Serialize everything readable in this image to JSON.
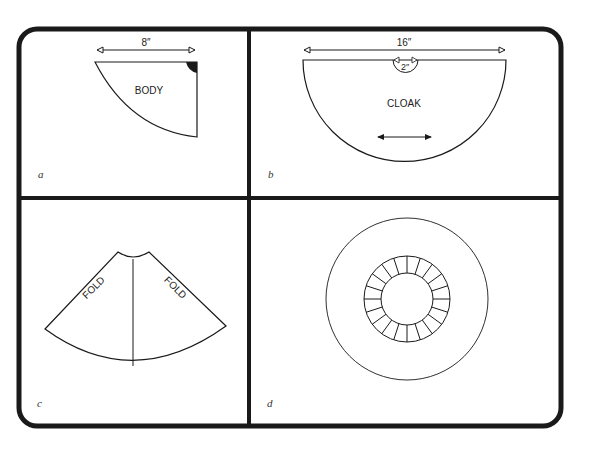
{
  "figure": {
    "panels": [
      {
        "letter": "a",
        "shape_label": "BODY",
        "dimension": "8″"
      },
      {
        "letter": "b",
        "shape_label": "CLOAK",
        "dimension": "16″",
        "inner_dimension": "2″"
      },
      {
        "letter": "c",
        "fold_labels": [
          "FOLD",
          "FOLD"
        ]
      },
      {
        "letter": "d",
        "ring_segments": 20
      }
    ]
  },
  "colors": {
    "line": "#1a1a1a",
    "background": "#ffffff"
  }
}
